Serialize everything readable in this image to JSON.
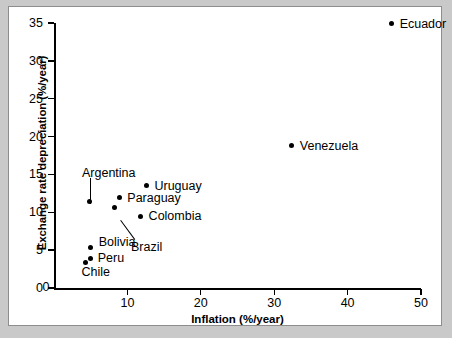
{
  "chart_data": {
    "type": "scatter",
    "title": "",
    "xlabel": "Inflation (%/year)",
    "ylabel": "Exchange rate depreciation (%/year)",
    "xlim": [
      0,
      50
    ],
    "ylim": [
      0,
      35
    ],
    "xticks": [
      0,
      10,
      20,
      30,
      40,
      50
    ],
    "yticks": [
      0,
      5,
      10,
      15,
      20,
      25,
      30,
      35
    ],
    "xtick_labels": [
      "0",
      "10",
      "20",
      "30",
      "40",
      "50"
    ],
    "ytick_labels": [
      "0",
      "5",
      "10",
      "15",
      "20",
      "25",
      "30",
      "35"
    ],
    "grid": false,
    "legend": "none",
    "points": [
      {
        "name": "Ecuador",
        "x": 46.0,
        "y": 34.9,
        "label": "Ecuador",
        "label_pos": "right",
        "leader": false
      },
      {
        "name": "Venezuela",
        "x": 32.4,
        "y": 18.8,
        "label": "Venezuela",
        "label_pos": "right",
        "leader": false
      },
      {
        "name": "Uruguay",
        "x": 12.6,
        "y": 13.5,
        "label": "Uruguay",
        "label_pos": "right",
        "leader": false
      },
      {
        "name": "Paraguay",
        "x": 8.9,
        "y": 12.0,
        "label": "Paraguay",
        "label_pos": "right",
        "leader": false
      },
      {
        "name": "Colombia",
        "x": 11.8,
        "y": 9.5,
        "label": "Colombia",
        "label_pos": "right",
        "leader": false
      },
      {
        "name": "Brazil",
        "x": 8.3,
        "y": 10.6,
        "label": "Brazil",
        "label_pos": "leader",
        "leader": true
      },
      {
        "name": "Argentina",
        "x": 4.8,
        "y": 11.4,
        "label": "Argentina",
        "label_pos": "leader",
        "leader": true
      },
      {
        "name": "Bolivia",
        "x": 5.0,
        "y": 5.4,
        "label": "Bolivia",
        "label_pos": "right",
        "leader": false
      },
      {
        "name": "Peru",
        "x": 5.0,
        "y": 3.9,
        "label": "Peru",
        "label_pos": "right",
        "leader": false
      },
      {
        "name": "Chile",
        "x": 4.3,
        "y": 3.4,
        "label": "Chile",
        "label_pos": "below",
        "leader": false
      }
    ],
    "colors": {
      "marker": "#000000",
      "axis": "#000000",
      "panel_background": "#ffffff",
      "page_background": "#c9c9c9",
      "panel_border": "#8d8d8d"
    }
  }
}
